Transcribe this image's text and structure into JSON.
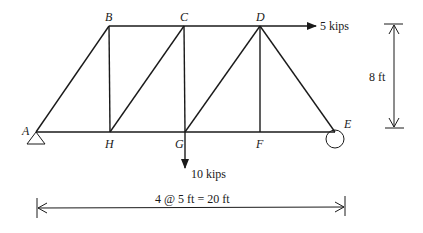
{
  "diagram": {
    "type": "truss",
    "nodes": {
      "A": {
        "label": "A",
        "x": 36,
        "y": 132
      },
      "B": {
        "label": "B",
        "x": 109,
        "y": 26
      },
      "C": {
        "label": "C",
        "x": 184,
        "y": 26
      },
      "D": {
        "label": "D",
        "x": 260,
        "y": 26
      },
      "E": {
        "label": "E",
        "x": 335,
        "y": 132
      },
      "F": {
        "label": "F",
        "x": 260,
        "y": 132
      },
      "G": {
        "label": "G",
        "x": 185,
        "y": 132
      },
      "H": {
        "label": "H",
        "x": 110,
        "y": 132
      }
    },
    "members": [
      "AB",
      "BC",
      "CD",
      "AH",
      "HG",
      "GF",
      "FE",
      "BH",
      "CG",
      "DF",
      "HC",
      "GD",
      "DE"
    ],
    "supports": {
      "A": "pin",
      "E": "roller"
    },
    "loads": {
      "horizontal": {
        "node": "D",
        "label": "5 kips",
        "direction": "right"
      },
      "vertical": {
        "node": "G",
        "label": "10 kips",
        "direction": "down"
      }
    },
    "dimensions": {
      "height": "8 ft",
      "span": "4 @ 5 ft = 20 ft"
    }
  }
}
